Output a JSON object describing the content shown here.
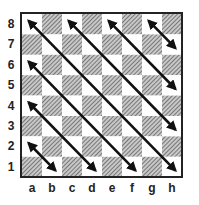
{
  "board": {
    "files": [
      "a",
      "b",
      "c",
      "d",
      "e",
      "f",
      "g",
      "h"
    ],
    "ranks": [
      "8",
      "7",
      "6",
      "5",
      "4",
      "3",
      "2",
      "1"
    ],
    "light_color": "#ffffff",
    "dark_color": "#9a9a9a",
    "border_color": "#222222"
  },
  "arrows": [
    {
      "from": "a8",
      "to": "h1",
      "double_headed": true
    },
    {
      "from": "c8",
      "to": "h3",
      "double_headed": true
    },
    {
      "from": "e8",
      "to": "h5",
      "double_headed": true
    },
    {
      "from": "g8",
      "to": "h7",
      "double_headed": true
    },
    {
      "from": "a6",
      "to": "f1",
      "double_headed": true
    },
    {
      "from": "a4",
      "to": "d1",
      "double_headed": true
    },
    {
      "from": "a2",
      "to": "b1",
      "double_headed": true
    }
  ]
}
